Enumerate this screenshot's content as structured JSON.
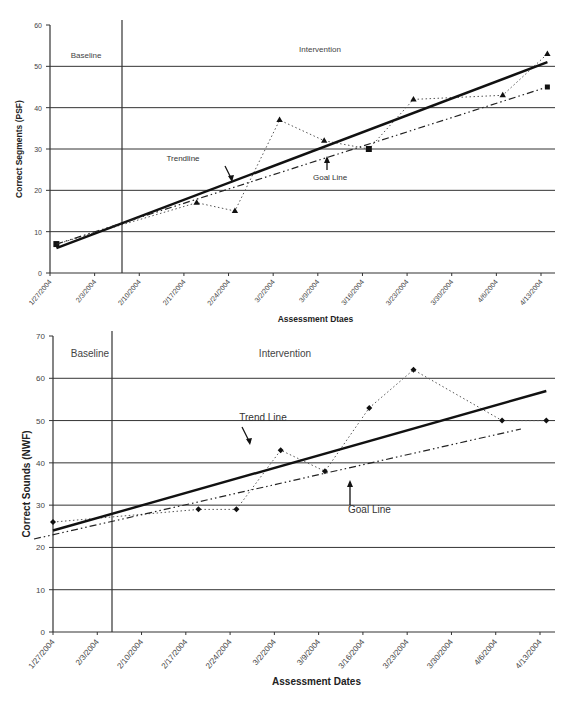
{
  "chart_data": [
    {
      "type": "line",
      "title": "",
      "xlabel": "Assessment Dtaes",
      "ylabel": "Correct Segments (PSF)",
      "ylim": [
        0,
        60
      ],
      "yticks": [
        0,
        10,
        20,
        30,
        40,
        50,
        60
      ],
      "grid": true,
      "categories": [
        "1/27/2004",
        "2/3/2004",
        "2/10/2004",
        "2/17/2004",
        "2/24/2004",
        "3/2/2004",
        "3/9/2004",
        "3/16/2004",
        "3/23/2004",
        "3/30/2004",
        "4/6/2004",
        "4/13/2004"
      ],
      "phase_labels": [
        "Baseline",
        "Intervention"
      ],
      "phase_change_after": "2/10/2004",
      "annotations": [
        "Trendline",
        "Goal Line"
      ],
      "series": [
        {
          "name": "Scores",
          "style": "dotted",
          "marker": "triangle",
          "points": [
            [
              "1/28/2004",
              7
            ],
            [
              "2/19/2004",
              17
            ],
            [
              "2/25/2004",
              15
            ],
            [
              "3/3/2004",
              37
            ],
            [
              "3/10/2004",
              32
            ],
            [
              "3/17/2004",
              30
            ],
            [
              "3/24/2004",
              42
            ],
            [
              "4/7/2004",
              43
            ],
            [
              "4/14/2004",
              53
            ]
          ]
        },
        {
          "name": "Trendline",
          "style": "solid-bold",
          "points": [
            [
              "1/28/2004",
              6
            ],
            [
              "4/14/2004",
              51
            ]
          ]
        },
        {
          "name": "Goal Line",
          "style": "dash-dot",
          "points": [
            [
              "1/28/2004",
              7
            ],
            [
              "4/14/2004",
              45
            ]
          ]
        }
      ]
    },
    {
      "type": "line",
      "title": "",
      "xlabel": "Assessment Dates",
      "ylabel": "Correct Sounds (NWF)",
      "ylim": [
        0,
        70
      ],
      "yticks": [
        0,
        10,
        20,
        30,
        40,
        50,
        60,
        70
      ],
      "grid": true,
      "categories": [
        "1/27/2004",
        "2/3/2004",
        "2/10/2004",
        "2/17/2004",
        "2/24/2004",
        "3/2/2004",
        "3/9/2004",
        "3/16/2004",
        "3/23/2004",
        "3/30/2004",
        "4/6/2004",
        "4/13/2004"
      ],
      "phase_labels": [
        "Baseline",
        "Intervention"
      ],
      "phase_change_after": "2/3/2004",
      "annotations": [
        "Trend Line",
        "Goal Line"
      ],
      "series": [
        {
          "name": "Scores",
          "style": "dotted",
          "marker": "diamond",
          "points": [
            [
              "1/27/2004",
              26
            ],
            [
              "2/19/2004",
              29
            ],
            [
              "2/25/2004",
              29
            ],
            [
              "3/3/2004",
              43
            ],
            [
              "3/10/2004",
              38
            ],
            [
              "3/17/2004",
              53
            ],
            [
              "3/24/2004",
              62
            ],
            [
              "4/7/2004",
              50
            ],
            [
              "4/14/2004",
              50
            ]
          ]
        },
        {
          "name": "Trend Line",
          "style": "solid-bold",
          "points": [
            [
              "1/27/2004",
              24
            ],
            [
              "4/14/2004",
              57
            ]
          ]
        },
        {
          "name": "Goal Line",
          "style": "dash-dot",
          "points": [
            [
              "1/24/2004",
              22
            ],
            [
              "4/10/2004",
              48
            ]
          ]
        }
      ]
    }
  ]
}
